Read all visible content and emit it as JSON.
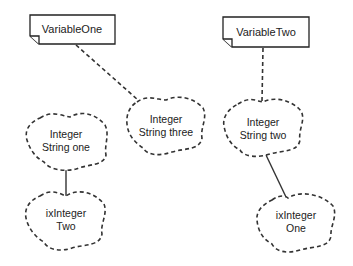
{
  "diagram": {
    "notes": [
      {
        "id": "variable-one",
        "label": "VariableOne"
      },
      {
        "id": "variable-two",
        "label": "VariableTwo"
      }
    ],
    "clouds": [
      {
        "id": "string-one",
        "line1": "Integer",
        "line2": "String one"
      },
      {
        "id": "string-three",
        "line1": "Integer",
        "line2": "String three"
      },
      {
        "id": "string-two",
        "line1": "Integer",
        "line2": "String two"
      },
      {
        "id": "ix-two",
        "line1": "ixInteger",
        "line2": "Two"
      },
      {
        "id": "ix-one",
        "line1": "ixInteger",
        "line2": "One"
      }
    ],
    "links": [
      {
        "from": "VariableOne",
        "to": "Integer String three",
        "style": "dashed"
      },
      {
        "from": "VariableTwo",
        "to": "Integer String two",
        "style": "dashed"
      },
      {
        "from": "Integer String one",
        "to": "ixInteger Two",
        "style": "solid"
      },
      {
        "from": "Integer String two",
        "to": "ixInteger One",
        "style": "solid"
      }
    ]
  }
}
